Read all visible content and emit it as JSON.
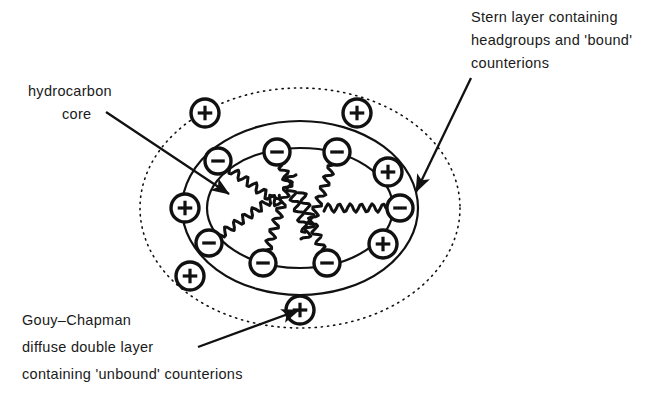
{
  "figure": {
    "background_color": "#ffffff",
    "ink_color": "#111111",
    "width": 663,
    "height": 400
  },
  "labels": {
    "stern": {
      "name": "stern-layer-label",
      "lines": [
        "Stern layer containing",
        "headgroups and 'bound'",
        "counterions"
      ]
    },
    "hydrocarbon": {
      "name": "hydrocarbon-core-label",
      "lines": [
        "hydrocarbon",
        "core"
      ]
    },
    "gouy": {
      "name": "gouy-chapman-label",
      "lines": [
        "Gouy–Chapman",
        "diffuse double layer",
        "containing 'unbound' counterions"
      ]
    }
  },
  "leaders": [
    {
      "name": "leader-stern-layer",
      "from_label": "stern",
      "x1": 471,
      "y1": 78,
      "x2": 416,
      "y2": 192
    },
    {
      "name": "leader-hydrocarbon-core",
      "from_label": "hydrocarbon",
      "x1": 106,
      "y1": 112,
      "x2": 229,
      "y2": 194
    },
    {
      "name": "leader-gouy-chapman",
      "from_label": "gouy",
      "x1": 198,
      "y1": 347,
      "x2": 299,
      "y2": 310
    }
  ],
  "shapes": {
    "diffuse_layer_ellipse": {
      "name": "gouy-chapman-diffuse-ellipse",
      "cx": 300,
      "cy": 208,
      "rx": 160,
      "ry": 120,
      "style": "dotted",
      "note": "outer boundary of Gouy-Chapman diffuse double layer"
    },
    "stern_layer_outer_ellipse": {
      "name": "stern-layer-outer-ellipse",
      "cx": 300,
      "cy": 208,
      "rx": 118,
      "ry": 87,
      "style": "solid",
      "note": "outer edge of Stern layer"
    },
    "hydrocarbon_core_ellipse": {
      "name": "hydrocarbon-core-ellipse",
      "cx": 300,
      "cy": 208,
      "rx": 93,
      "ry": 60,
      "style": "solid",
      "note": "hydrocarbon core boundary"
    }
  },
  "ions": {
    "bound_counterions_symbol": "+",
    "headgroups_symbol": "−",
    "headgroups": [
      {
        "name": "headgroup-anion-1",
        "charge": "minus",
        "cx": 218,
        "cy": 161,
        "r": 13,
        "tail_angle_deg": 35
      },
      {
        "name": "headgroup-anion-2",
        "charge": "minus",
        "cx": 277,
        "cy": 152,
        "r": 13,
        "tail_angle_deg": 70
      },
      {
        "name": "headgroup-anion-3",
        "charge": "minus",
        "cx": 337,
        "cy": 152,
        "r": 13,
        "tail_angle_deg": 110
      },
      {
        "name": "headgroup-anion-4",
        "charge": "minus",
        "cx": 400,
        "cy": 208,
        "r": 13,
        "tail_angle_deg": 180
      },
      {
        "name": "headgroup-anion-5",
        "charge": "minus",
        "cx": 209,
        "cy": 243,
        "r": 13,
        "tail_angle_deg": 325
      },
      {
        "name": "headgroup-anion-6",
        "charge": "minus",
        "cx": 263,
        "cy": 263,
        "r": 13,
        "tail_angle_deg": 288
      },
      {
        "name": "headgroup-anion-7",
        "charge": "minus",
        "cx": 327,
        "cy": 263,
        "r": 13,
        "tail_angle_deg": 250
      }
    ],
    "bound_counterions": [
      {
        "name": "bound-counterion-1",
        "charge": "plus",
        "cx": 185,
        "cy": 208,
        "r": 14
      },
      {
        "name": "bound-counterion-2",
        "charge": "plus",
        "cx": 388,
        "cy": 172,
        "r": 14
      },
      {
        "name": "bound-counterion-3",
        "charge": "plus",
        "cx": 383,
        "cy": 244,
        "r": 14
      }
    ],
    "unbound_counterions": [
      {
        "name": "unbound-counterion-1",
        "charge": "plus",
        "cx": 205,
        "cy": 113,
        "r": 14
      },
      {
        "name": "unbound-counterion-2",
        "charge": "plus",
        "cx": 357,
        "cy": 113,
        "r": 14
      },
      {
        "name": "unbound-counterion-3",
        "charge": "plus",
        "cx": 190,
        "cy": 276,
        "r": 14
      },
      {
        "name": "unbound-counterion-4",
        "charge": "plus",
        "cx": 300,
        "cy": 310,
        "r": 14
      }
    ]
  }
}
